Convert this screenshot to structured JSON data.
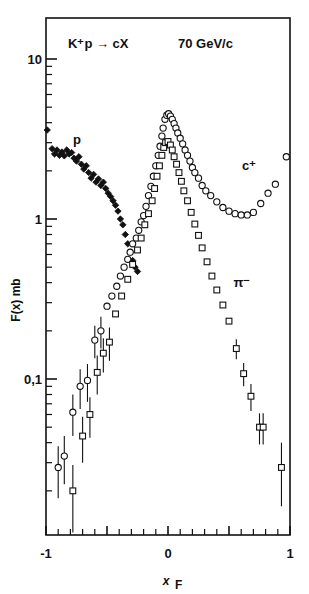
{
  "figure": {
    "title_reaction": "K⁺p → cX",
    "title_energy": "70 GeV/c",
    "ylabel": "F(x)  mb",
    "xlabel": "x",
    "xlabel_sub": "F"
  },
  "annotations": {
    "proton": "p",
    "charged": "c⁺",
    "pion": "π⁻"
  },
  "axes": {
    "x_ticks_major": [
      "-1",
      "0",
      "1"
    ],
    "y_ticks_major": [
      "10",
      "1",
      "0,1"
    ],
    "xlim": [
      -1,
      1
    ],
    "ylim": [
      0.015,
      13
    ],
    "x_minor_step": 0.1,
    "log_y": true
  },
  "chart_data": {
    "type": "scatter",
    "title": "K⁺p → cX    70 GeV/c",
    "xlabel": "x_F",
    "ylabel": "F(x) mb",
    "xlim": [
      -1,
      1
    ],
    "ylim": [
      0.015,
      13
    ],
    "yscale": "log",
    "grid": false,
    "legend": "inline annotations (p, c⁺, π⁻)",
    "series": [
      {
        "name": "p",
        "marker": "filled-diamond",
        "color": "#111111",
        "points": [
          {
            "x": -0.99,
            "y": 3.6
          },
          {
            "x": -0.95,
            "y": 2.75
          },
          {
            "x": -0.93,
            "y": 2.55
          },
          {
            "x": -0.91,
            "y": 2.7
          },
          {
            "x": -0.89,
            "y": 2.5
          },
          {
            "x": -0.87,
            "y": 2.62
          },
          {
            "x": -0.85,
            "y": 2.48
          },
          {
            "x": -0.83,
            "y": 2.7
          },
          {
            "x": -0.81,
            "y": 2.55
          },
          {
            "x": -0.79,
            "y": 2.6
          },
          {
            "x": -0.77,
            "y": 2.4
          },
          {
            "x": -0.75,
            "y": 2.3
          },
          {
            "x": -0.73,
            "y": 2.45
          },
          {
            "x": -0.71,
            "y": 2.2
          },
          {
            "x": -0.69,
            "y": 2.05
          },
          {
            "x": -0.67,
            "y": 2.15
          },
          {
            "x": -0.65,
            "y": 1.95
          },
          {
            "x": -0.63,
            "y": 1.8
          },
          {
            "x": -0.61,
            "y": 1.9
          },
          {
            "x": -0.59,
            "y": 1.7
          },
          {
            "x": -0.57,
            "y": 1.78
          },
          {
            "x": -0.55,
            "y": 1.62
          },
          {
            "x": -0.53,
            "y": 1.7
          },
          {
            "x": -0.51,
            "y": 1.55
          },
          {
            "x": -0.49,
            "y": 1.45
          },
          {
            "x": -0.47,
            "y": 1.38
          },
          {
            "x": -0.45,
            "y": 1.3
          },
          {
            "x": -0.43,
            "y": 1.22
          },
          {
            "x": -0.41,
            "y": 1.12
          },
          {
            "x": -0.39,
            "y": 1.0
          },
          {
            "x": -0.37,
            "y": 0.92
          },
          {
            "x": -0.35,
            "y": 0.8
          },
          {
            "x": -0.33,
            "y": 0.7
          },
          {
            "x": -0.31,
            "y": 0.62
          },
          {
            "x": -0.29,
            "y": 0.55
          },
          {
            "x": -0.27,
            "y": 0.5
          },
          {
            "x": -0.25,
            "y": 0.47
          }
        ]
      },
      {
        "name": "c+",
        "marker": "open-circle",
        "color": "#111111",
        "points": [
          {
            "x": -0.9,
            "y": 0.028,
            "err": 0.01
          },
          {
            "x": -0.85,
            "y": 0.033,
            "err": 0.011
          },
          {
            "x": -0.78,
            "y": 0.062,
            "err": 0.018
          },
          {
            "x": -0.72,
            "y": 0.09,
            "err": 0.025
          },
          {
            "x": -0.66,
            "y": 0.098,
            "err": 0.026
          },
          {
            "x": -0.6,
            "y": 0.175,
            "err": 0.04
          },
          {
            "x": -0.55,
            "y": 0.2,
            "err": 0.045
          },
          {
            "x": -0.5,
            "y": 0.285
          },
          {
            "x": -0.46,
            "y": 0.33
          },
          {
            "x": -0.42,
            "y": 0.38
          },
          {
            "x": -0.39,
            "y": 0.44
          },
          {
            "x": -0.36,
            "y": 0.5
          },
          {
            "x": -0.33,
            "y": 0.56
          },
          {
            "x": -0.31,
            "y": 0.62
          },
          {
            "x": -0.29,
            "y": 0.7
          },
          {
            "x": -0.26,
            "y": 0.76
          },
          {
            "x": -0.24,
            "y": 0.85
          },
          {
            "x": -0.22,
            "y": 0.96
          },
          {
            "x": -0.2,
            "y": 1.05
          },
          {
            "x": -0.18,
            "y": 1.2
          },
          {
            "x": -0.16,
            "y": 1.4
          },
          {
            "x": -0.14,
            "y": 1.6
          },
          {
            "x": -0.12,
            "y": 1.85
          },
          {
            "x": -0.1,
            "y": 2.15
          },
          {
            "x": -0.08,
            "y": 2.5
          },
          {
            "x": -0.065,
            "y": 2.85
          },
          {
            "x": -0.05,
            "y": 3.3
          },
          {
            "x": -0.04,
            "y": 3.7
          },
          {
            "x": -0.025,
            "y": 4.2
          },
          {
            "x": -0.01,
            "y": 4.45
          },
          {
            "x": 0.005,
            "y": 4.55
          },
          {
            "x": 0.02,
            "y": 4.4
          },
          {
            "x": 0.035,
            "y": 4.2
          },
          {
            "x": 0.05,
            "y": 3.95
          },
          {
            "x": 0.065,
            "y": 3.7
          },
          {
            "x": 0.08,
            "y": 3.45
          },
          {
            "x": 0.1,
            "y": 3.2
          },
          {
            "x": 0.12,
            "y": 2.95
          },
          {
            "x": 0.14,
            "y": 2.7
          },
          {
            "x": 0.16,
            "y": 2.5
          },
          {
            "x": 0.18,
            "y": 2.3
          },
          {
            "x": 0.2,
            "y": 2.1
          },
          {
            "x": 0.22,
            "y": 1.95
          },
          {
            "x": 0.25,
            "y": 1.8
          },
          {
            "x": 0.28,
            "y": 1.62
          },
          {
            "x": 0.31,
            "y": 1.5
          },
          {
            "x": 0.35,
            "y": 1.4
          },
          {
            "x": 0.4,
            "y": 1.28
          },
          {
            "x": 0.45,
            "y": 1.18
          },
          {
            "x": 0.5,
            "y": 1.12
          },
          {
            "x": 0.55,
            "y": 1.08
          },
          {
            "x": 0.6,
            "y": 1.06
          },
          {
            "x": 0.65,
            "y": 1.06
          },
          {
            "x": 0.7,
            "y": 1.1
          },
          {
            "x": 0.76,
            "y": 1.25
          },
          {
            "x": 0.82,
            "y": 1.45
          },
          {
            "x": 0.88,
            "y": 1.65
          },
          {
            "x": 0.97,
            "y": 2.45
          }
        ]
      },
      {
        "name": "pi-",
        "marker": "open-square",
        "color": "#111111",
        "points": [
          {
            "x": -0.78,
            "y": 0.02,
            "err": 0.009
          },
          {
            "x": -0.7,
            "y": 0.044,
            "err": 0.014
          },
          {
            "x": -0.64,
            "y": 0.06,
            "err": 0.017
          },
          {
            "x": -0.58,
            "y": 0.11,
            "err": 0.03
          },
          {
            "x": -0.53,
            "y": 0.145,
            "err": 0.035
          },
          {
            "x": -0.48,
            "y": 0.17,
            "err": 0.04
          },
          {
            "x": -0.43,
            "y": 0.255
          },
          {
            "x": -0.38,
            "y": 0.33
          },
          {
            "x": -0.33,
            "y": 0.42
          },
          {
            "x": -0.29,
            "y": 0.52
          },
          {
            "x": -0.25,
            "y": 0.64
          },
          {
            "x": -0.22,
            "y": 0.76
          },
          {
            "x": -0.19,
            "y": 0.92
          },
          {
            "x": -0.16,
            "y": 1.08
          },
          {
            "x": -0.13,
            "y": 1.3
          },
          {
            "x": -0.11,
            "y": 1.55
          },
          {
            "x": -0.09,
            "y": 1.85
          },
          {
            "x": -0.07,
            "y": 2.15
          },
          {
            "x": -0.05,
            "y": 2.5
          },
          {
            "x": -0.035,
            "y": 2.8
          },
          {
            "x": -0.02,
            "y": 3.0
          },
          {
            "x": 0.0,
            "y": 3.05
          },
          {
            "x": 0.02,
            "y": 2.9
          },
          {
            "x": 0.035,
            "y": 2.7
          },
          {
            "x": 0.05,
            "y": 2.45
          },
          {
            "x": 0.07,
            "y": 2.2
          },
          {
            "x": 0.09,
            "y": 1.95
          },
          {
            "x": 0.11,
            "y": 1.72
          },
          {
            "x": 0.13,
            "y": 1.5
          },
          {
            "x": 0.16,
            "y": 1.3
          },
          {
            "x": 0.19,
            "y": 1.1
          },
          {
            "x": 0.22,
            "y": 0.93
          },
          {
            "x": 0.25,
            "y": 0.79
          },
          {
            "x": 0.28,
            "y": 0.66
          },
          {
            "x": 0.32,
            "y": 0.54
          },
          {
            "x": 0.36,
            "y": 0.44
          },
          {
            "x": 0.4,
            "y": 0.36
          },
          {
            "x": 0.45,
            "y": 0.29
          },
          {
            "x": 0.5,
            "y": 0.23
          },
          {
            "x": 0.56,
            "y": 0.155,
            "err": 0.022
          },
          {
            "x": 0.62,
            "y": 0.108,
            "err": 0.018
          },
          {
            "x": 0.68,
            "y": 0.078,
            "err": 0.015
          },
          {
            "x": 0.75,
            "y": 0.05,
            "err": 0.011
          },
          {
            "x": 0.78,
            "y": 0.05,
            "err": 0.011
          },
          {
            "x": 0.93,
            "y": 0.028,
            "err": 0.012
          }
        ]
      }
    ]
  },
  "geometry": {
    "plot_left": 46,
    "plot_right": 290,
    "plot_top": 18,
    "plot_bottom": 535,
    "y_decade_px": 160,
    "y_ref_value": 10,
    "y_ref_px": 59
  }
}
